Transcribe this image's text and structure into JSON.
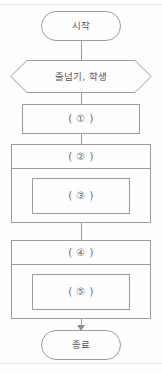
{
  "diagram": {
    "nodes": {
      "start": {
        "label": "시작",
        "shape": "terminator"
      },
      "declare": {
        "label": "줄넘기, 학생",
        "shape": "hexagon"
      },
      "process_1": {
        "label": "( ① )",
        "shape": "process"
      },
      "loop_1_header": {
        "label": "( ② )",
        "shape": "loop-header"
      },
      "loop_1_inner": {
        "label": "( ③ )",
        "shape": "process"
      },
      "loop_2_header": {
        "label": "( ④ )",
        "shape": "loop-header"
      },
      "loop_2_inner": {
        "label": "( ⑤ )",
        "shape": "process"
      },
      "end": {
        "label": "종료",
        "shape": "terminator"
      }
    },
    "colors": {
      "stroke": "#9b9ba0",
      "text": "#58585d",
      "background": "#fefefe",
      "rule": "#e9e9ec"
    }
  }
}
